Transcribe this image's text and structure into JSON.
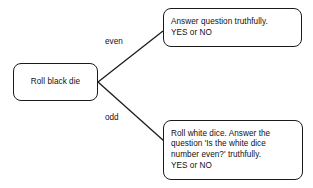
{
  "diagram": {
    "background_color": "#ffffff",
    "stroke_color": "#1b1b1b",
    "text_color": "#111111",
    "nodes": [
      {
        "id": "start",
        "label": "Roll black die",
        "shape": "rounded-rectangle"
      },
      {
        "id": "even_branch",
        "label": "Answer question truthfully.\nYES or NO",
        "shape": "rounded-rectangle"
      },
      {
        "id": "odd_branch",
        "label": "Roll white dice. Answer the\nquestion 'Is the white dice\nnumber even?' truthfully.\nYES or NO",
        "shape": "rounded-rectangle"
      }
    ],
    "edges": [
      {
        "id": "edge-even",
        "from": "start",
        "to": "even_branch",
        "label": "even"
      },
      {
        "id": "edge-odd",
        "from": "start",
        "to": "odd_branch",
        "label": "odd"
      }
    ]
  }
}
